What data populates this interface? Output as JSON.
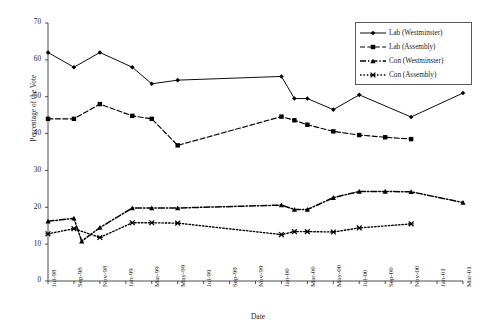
{
  "chart_data": {
    "type": "line",
    "title": "",
    "xlabel": "Date",
    "ylabel": "Percentage of the Vote",
    "ylim": [
      0,
      70
    ],
    "ytick_step": 10,
    "yticks": [
      0,
      10,
      20,
      30,
      40,
      50,
      60,
      70
    ],
    "grid": false,
    "legend_position": "top-right",
    "categories": [
      "Jul-98",
      "Sep-98",
      "Nov-98",
      "Jan-99",
      "Mar-99",
      "May-99",
      "Jul-99",
      "Sep-99",
      "Nov-99",
      "Jan-00",
      "Mar-00",
      "May-00",
      "Jul-00",
      "Sep-00",
      "Nov-00",
      "Jan-01",
      "Mar-01"
    ],
    "series": [
      {
        "name": "Lab (Westminster)",
        "marker": "diamond",
        "line_style": "solid",
        "color": "#000000",
        "points": [
          {
            "x": "Jul-98",
            "xi": 0.0,
            "y": 62.0
          },
          {
            "x": "Sep-98",
            "xi": 1.0,
            "y": 58.0
          },
          {
            "x": "Nov-98",
            "xi": 2.0,
            "y": 62.0
          },
          {
            "x": "Jan-99",
            "xi": 3.25,
            "y": 58.0
          },
          {
            "x": "Mar-99",
            "xi": 4.0,
            "y": 53.5
          },
          {
            "x": "May-99",
            "xi": 5.0,
            "y": 54.5
          },
          {
            "x": "Jan-00",
            "xi": 9.0,
            "y": 55.5
          },
          {
            "x": "Feb-00",
            "xi": 9.5,
            "y": 49.5
          },
          {
            "x": "Mar-00",
            "xi": 10.0,
            "y": 49.5
          },
          {
            "x": "May-00",
            "xi": 11.0,
            "y": 46.5
          },
          {
            "x": "Jul-00",
            "xi": 12.0,
            "y": 50.5
          },
          {
            "x": "Nov-00",
            "xi": 14.0,
            "y": 44.5
          },
          {
            "x": "Mar-01",
            "xi": 16.0,
            "y": 51.0
          }
        ]
      },
      {
        "name": "Lab (Assembly)",
        "marker": "square",
        "line_style": "dashed",
        "color": "#000000",
        "points": [
          {
            "x": "Jul-98",
            "xi": 0.0,
            "y": 44.0
          },
          {
            "x": "Sep-98",
            "xi": 1.0,
            "y": 44.0
          },
          {
            "x": "Nov-98",
            "xi": 2.0,
            "y": 48.0
          },
          {
            "x": "Jan-99",
            "xi": 3.25,
            "y": 44.8
          },
          {
            "x": "Mar-99",
            "xi": 4.0,
            "y": 44.0
          },
          {
            "x": "May-99",
            "xi": 5.0,
            "y": 36.8
          },
          {
            "x": "Jan-00",
            "xi": 9.0,
            "y": 44.6
          },
          {
            "x": "Feb-00",
            "xi": 9.5,
            "y": 43.6
          },
          {
            "x": "Mar-00",
            "xi": 10.0,
            "y": 42.4
          },
          {
            "x": "May-00",
            "xi": 11.0,
            "y": 40.6
          },
          {
            "x": "Jul-00",
            "xi": 12.0,
            "y": 39.6
          },
          {
            "x": "Sep-00",
            "xi": 13.0,
            "y": 39.0
          },
          {
            "x": "Nov-00",
            "xi": 14.0,
            "y": 38.5
          }
        ]
      },
      {
        "name": "Con (Westminster)",
        "marker": "triangle",
        "line_style": "dash-dot",
        "color": "#000000",
        "points": [
          {
            "x": "Jul-98",
            "xi": 0.0,
            "y": 16.2
          },
          {
            "x": "Sep-98",
            "xi": 1.0,
            "y": 17.0
          },
          {
            "x": "Oct-98",
            "xi": 1.3,
            "y": 10.8
          },
          {
            "x": "Nov-98",
            "xi": 2.0,
            "y": 14.5
          },
          {
            "x": "Jan-99",
            "xi": 3.25,
            "y": 19.8
          },
          {
            "x": "Mar-99",
            "xi": 4.0,
            "y": 19.8
          },
          {
            "x": "May-99",
            "xi": 5.0,
            "y": 19.8
          },
          {
            "x": "Jan-00",
            "xi": 9.0,
            "y": 20.6
          },
          {
            "x": "Feb-00",
            "xi": 9.5,
            "y": 19.4
          },
          {
            "x": "Mar-00",
            "xi": 10.0,
            "y": 19.4
          },
          {
            "x": "May-00",
            "xi": 11.0,
            "y": 22.6
          },
          {
            "x": "Jul-00",
            "xi": 12.0,
            "y": 24.3
          },
          {
            "x": "Sep-00",
            "xi": 13.0,
            "y": 24.3
          },
          {
            "x": "Nov-00",
            "xi": 14.0,
            "y": 24.2
          },
          {
            "x": "Mar-01",
            "xi": 16.0,
            "y": 21.3
          }
        ]
      },
      {
        "name": "Con (Assembly)",
        "marker": "cross",
        "line_style": "dotted",
        "color": "#000000",
        "points": [
          {
            "x": "Jul-98",
            "xi": 0.0,
            "y": 12.8
          },
          {
            "x": "Sep-98",
            "xi": 1.0,
            "y": 14.2
          },
          {
            "x": "Nov-98",
            "xi": 2.0,
            "y": 11.8
          },
          {
            "x": "Jan-99",
            "xi": 3.25,
            "y": 15.8
          },
          {
            "x": "Mar-99",
            "xi": 4.0,
            "y": 15.8
          },
          {
            "x": "May-99",
            "xi": 5.0,
            "y": 15.7
          },
          {
            "x": "Jan-00",
            "xi": 9.0,
            "y": 12.6
          },
          {
            "x": "Feb-00",
            "xi": 9.5,
            "y": 13.4
          },
          {
            "x": "Mar-00",
            "xi": 10.0,
            "y": 13.4
          },
          {
            "x": "May-00",
            "xi": 11.0,
            "y": 13.3
          },
          {
            "x": "Jul-00",
            "xi": 12.0,
            "y": 14.4
          },
          {
            "x": "Nov-00",
            "xi": 14.0,
            "y": 15.5
          }
        ]
      }
    ]
  },
  "legend": {
    "items": [
      {
        "label": "Lab (Westminster)"
      },
      {
        "label": "Lab (Assembly)"
      },
      {
        "label": "Con (Westminster)"
      },
      {
        "label": "Con (Assembly)"
      }
    ]
  }
}
